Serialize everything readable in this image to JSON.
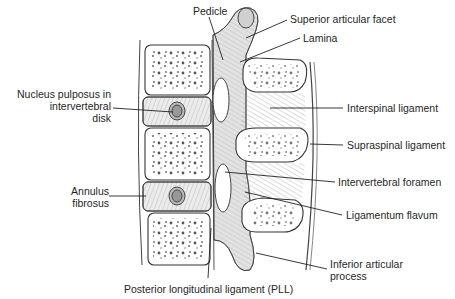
{
  "figure": {
    "labels": {
      "pedicle": "Pedicle",
      "superior_articular_facet": "Superior articular facet",
      "lamina": "Lamina",
      "nucleus_pulposus_line1": "Nucleus pulposus in",
      "nucleus_pulposus_line2": "intervertebral",
      "nucleus_pulposus_line3": "disk",
      "interspinal_ligament": "Interspinal ligament",
      "supraspinal_ligament": "Supraspinal ligament",
      "annulus_line1": "Annulus",
      "annulus_line2": "fibrosus",
      "intervertebral_foramen": "Intervertebral foramen",
      "ligamentum_flavum": "Ligamentum flavum",
      "inferior_articular_line1": "Inferior articular",
      "inferior_articular_line2": "process",
      "pll": "Posterior longitudinal ligament (PLL)"
    },
    "colors": {
      "ink": "#333333",
      "bone": "#ffffff",
      "shade": "#d9d9d9",
      "disk": "#e6e6e6"
    }
  }
}
